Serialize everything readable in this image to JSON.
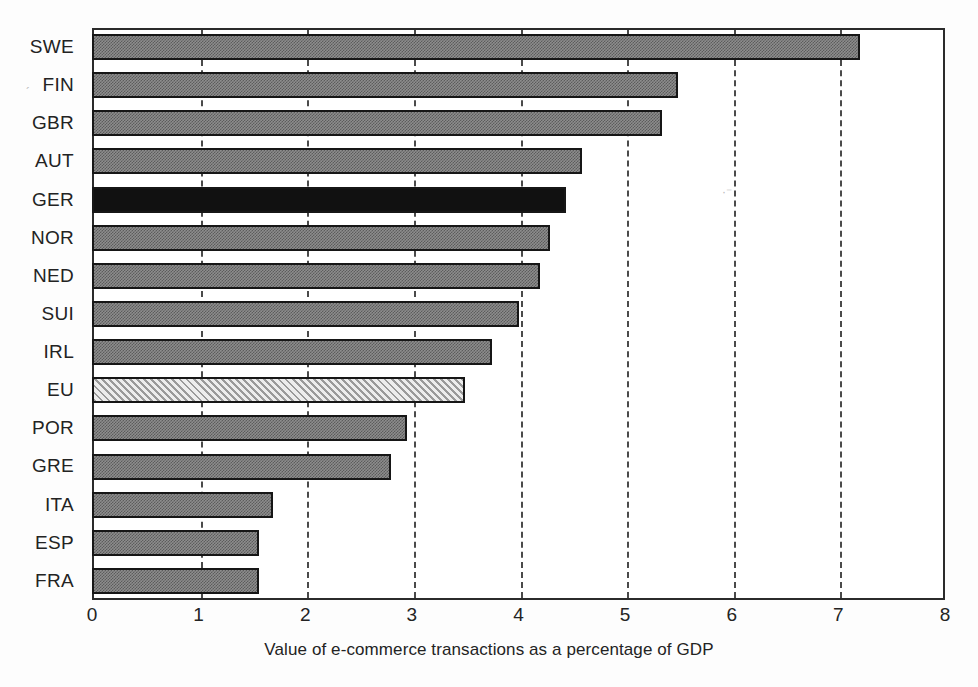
{
  "chart_data": {
    "type": "bar",
    "orientation": "horizontal",
    "title": "",
    "subtitle": "",
    "xlabel": "Value of e-commerce transactions as a percentage of GDP",
    "ylabel": "",
    "xlim": [
      0,
      8
    ],
    "ylim": null,
    "xticks": [
      "0",
      "1",
      "2",
      "3",
      "4",
      "5",
      "6",
      "7",
      "8"
    ],
    "xtick_values": [
      0,
      1,
      2,
      3,
      4,
      5,
      6,
      7,
      8
    ],
    "grid": "vertical dashed gridlines at 1,2,3,4,5,6,7",
    "legend": "none",
    "categories": [
      "SWE",
      "FIN",
      "GBR",
      "AUT",
      "GER",
      "NOR",
      "NED",
      "SUI",
      "IRL",
      "EU",
      "POR",
      "GRE",
      "ITA",
      "ESP",
      "FRA"
    ],
    "values": [
      7.2,
      5.5,
      5.35,
      4.6,
      4.45,
      4.3,
      4.2,
      4.0,
      3.75,
      3.5,
      2.95,
      2.8,
      1.7,
      1.57,
      1.57
    ],
    "bars": [
      {
        "label": "SWE",
        "value": 7.2,
        "style": "dither",
        "highlight": false
      },
      {
        "label": "FIN",
        "value": 5.5,
        "style": "dither",
        "highlight": false
      },
      {
        "label": "GBR",
        "value": 5.35,
        "style": "dither",
        "highlight": false
      },
      {
        "label": "AUT",
        "value": 4.6,
        "style": "dither",
        "highlight": false
      },
      {
        "label": "GER",
        "value": 4.45,
        "style": "solid",
        "highlight": true
      },
      {
        "label": "NOR",
        "value": 4.3,
        "style": "dither",
        "highlight": false
      },
      {
        "label": "NED",
        "value": 4.2,
        "style": "dither",
        "highlight": false
      },
      {
        "label": "SUI",
        "value": 4.0,
        "style": "dither",
        "highlight": false
      },
      {
        "label": "IRL",
        "value": 3.75,
        "style": "dither",
        "highlight": false
      },
      {
        "label": "EU",
        "value": 3.5,
        "style": "hatch",
        "highlight": false
      },
      {
        "label": "POR",
        "value": 2.95,
        "style": "dither",
        "highlight": false
      },
      {
        "label": "GRE",
        "value": 2.8,
        "style": "dither",
        "highlight": false
      },
      {
        "label": "ITA",
        "value": 1.7,
        "style": "dither",
        "highlight": false
      },
      {
        "label": "ESP",
        "value": 1.57,
        "style": "dither",
        "highlight": false
      },
      {
        "label": "FRA",
        "value": 1.57,
        "style": "dither",
        "highlight": false
      }
    ],
    "colors": {
      "bar_fill": "#8d8d8d",
      "bar_fill_dark": "#5c5c5c",
      "bar_highlight": "#111111",
      "bar_hatch_light": "#e2e2e2",
      "bar_hatch_line": "#9a9a9a",
      "bar_border": "#161616",
      "axis": "#2b2b2b",
      "gridline": "#4a4a4a",
      "text": "#232323",
      "background": "#ffffff"
    }
  }
}
